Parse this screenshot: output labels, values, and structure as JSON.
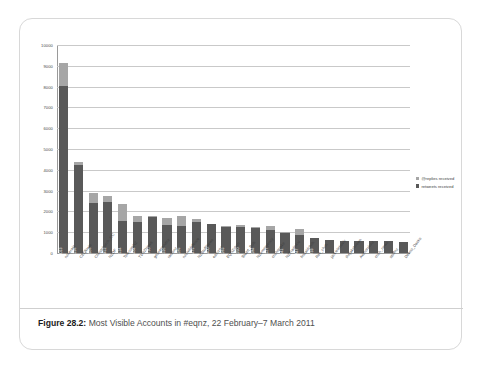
{
  "figure": {
    "caption_label": "Figure 28.2:",
    "caption_text": " Most Visible Accounts in #eqnz, 22 February–7 March 2011"
  },
  "legend": {
    "position": "right",
    "items": [
      {
        "label": "@replies received",
        "color": "#a6a6a6",
        "swatch": "replies"
      },
      {
        "label": "retweets received",
        "color": "#595959",
        "swatch": "retweets"
      }
    ]
  },
  "chart_data": {
    "type": "bar",
    "stacked": true,
    "title": "",
    "xlabel": "",
    "ylabel": "",
    "ylim": [
      0,
      10000
    ],
    "grid": true,
    "ytick_labels": [
      "10000",
      "9000",
      "8000",
      "7000",
      "6000",
      "5000",
      "4000",
      "3000",
      "2000",
      "1000",
      "0"
    ],
    "ytick_values": [
      10000,
      9000,
      8000,
      7000,
      6000,
      5000,
      4000,
      3000,
      2000,
      1000,
      0
    ],
    "categories": [
      "nzherald",
      "CEQkiwis",
      "Christchurch_CC",
      "NZDF",
      "TelecomNZ",
      "TVNZNews",
      "geonetgovtnz",
      "radionz",
      "nzcivildefence",
      "NZStuffNews",
      "earnznz",
      "EQNZchch",
      "Stuart_Rob",
      "NZemergency",
      "chchquake",
      "NZTradeAid",
      "firstaidchch",
      "Rec_chch",
      "jackielebovic",
      "thejakebrown",
      "Authorsinnz",
      "chch_news",
      "stuffnz",
      "Deano_Dacko"
    ],
    "series": [
      {
        "name": "retweets received",
        "color": "#595959",
        "values": [
          8013,
          4236,
          2386,
          2452,
          1524,
          1484,
          1730,
          1326,
          1285,
          1475,
          1400,
          1263,
          1250,
          1184,
          1127,
          941,
          847,
          733,
          610,
          600,
          590,
          580,
          565,
          530
        ]
      },
      {
        "name": "@replies received",
        "color": "#a6a6a6",
        "values": [
          1107,
          120,
          480,
          300,
          820,
          320,
          55,
          380,
          500,
          160,
          0,
          30,
          120,
          80,
          150,
          90,
          290,
          0,
          0,
          0,
          0,
          0,
          0,
          0
        ]
      }
    ],
    "bar_value_labels": [
      "8013",
      "4236",
      "2386",
      "2452",
      "1524",
      "1484",
      "1730",
      "1326",
      "1285",
      "1475",
      "1400",
      "1263",
      "1250",
      "1184",
      "1127",
      "941",
      "847",
      "733",
      "",
      "",
      "",
      "",
      "",
      ""
    ]
  }
}
